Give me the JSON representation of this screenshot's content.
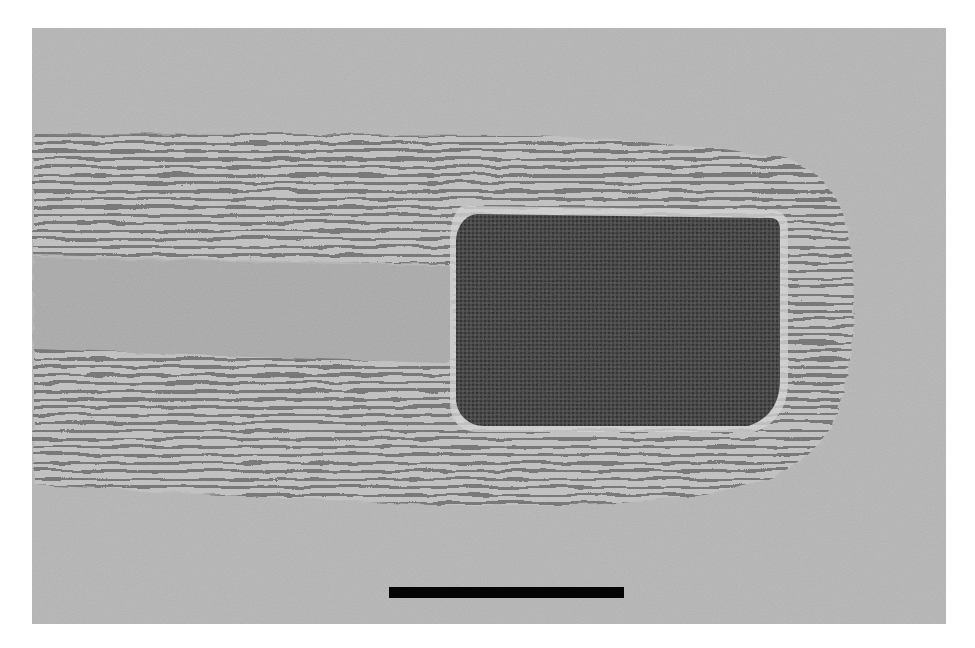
{
  "figure": {
    "type": "TEM micrograph",
    "background_color": "#b4b4b4",
    "core_color": "#aaaaaa",
    "particle_color": "#3a3a3a",
    "fringe_dark_color": "#6e6e6e",
    "fringe_light_color": "#c6c6c6"
  },
  "scale_bar": {
    "label": "",
    "color": "#050505",
    "length_px": 235
  }
}
